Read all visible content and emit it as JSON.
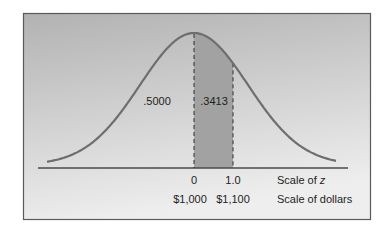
{
  "figure": {
    "type": "normal-distribution-diagram",
    "panel": {
      "gradient_top": "#b2b2b2",
      "gradient_bottom": "#eeeeee",
      "border_color": "#5a5a5a"
    },
    "curve_color": "#6e6e6e",
    "shaded_color": "#a2a2a2",
    "axis_color": "#4a4a4a",
    "area_labels": {
      "left_half": ".5000",
      "shaded": ".3413"
    },
    "z_scale": {
      "ticks": [
        {
          "value": 0,
          "label": "0"
        },
        {
          "value": 1.0,
          "label": "1.0"
        }
      ],
      "label_prefix": "Scale of ",
      "label_var": "z"
    },
    "dollar_scale": {
      "ticks": [
        {
          "z": 0,
          "label": "$1,000"
        },
        {
          "z": 1.0,
          "label": "$1,100"
        }
      ],
      "label": "Scale of dollars"
    }
  }
}
